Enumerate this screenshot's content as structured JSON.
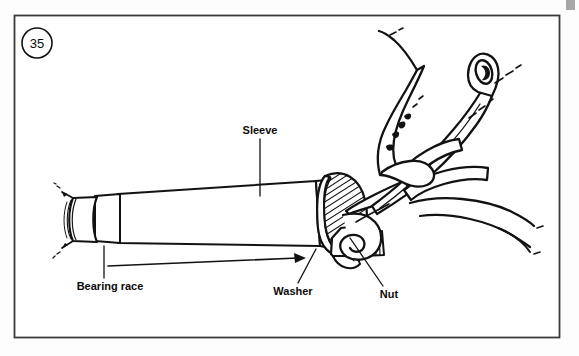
{
  "figure": {
    "number": "35",
    "caption_style": "circled-number",
    "border_color": "#3a3a3a",
    "ink_color": "#121212",
    "background_color": "#fdfdfd",
    "frame": {
      "x": 14,
      "y": 15,
      "width": 546,
      "height": 323
    }
  },
  "labels": [
    {
      "id": "sleeve",
      "text": "Sleeve",
      "text_x": 260,
      "text_y": 133,
      "anchor": "middle",
      "leader": {
        "type": "line",
        "x1": 260,
        "y1": 139,
        "x2": 260,
        "y2": 196
      }
    },
    {
      "id": "bearing-race",
      "text": "Bearing race",
      "text_x": 110,
      "text_y": 289,
      "anchor": "middle",
      "leader": {
        "type": "line",
        "x1": 104,
        "y1": 246,
        "x2": 104,
        "y2": 278
      }
    },
    {
      "id": "washer",
      "text": "Washer",
      "text_x": 293,
      "text_y": 294,
      "anchor": "middle",
      "leader": {
        "type": "line",
        "x1": 298,
        "y1": 283,
        "x2": 316,
        "y2": 249
      }
    },
    {
      "id": "nut",
      "text": "Nut",
      "text_x": 389,
      "text_y": 297,
      "anchor": "middle",
      "leader": {
        "type": "line",
        "x1": 383,
        "y1": 286,
        "x2": 351,
        "y2": 240
      }
    }
  ],
  "pointer_arrow": {
    "id": "washer-pointer",
    "x1": 108,
    "y1": 266,
    "x2": 304,
    "y2": 258,
    "head": "solid-triangle"
  },
  "parts": [
    {
      "name": "sleeve",
      "description": "long tapered cylinder shaft"
    },
    {
      "name": "bearing race",
      "description": "ring band near left cut end of shaft"
    },
    {
      "name": "washer",
      "description": "hatched flange disc at right end of sleeve"
    },
    {
      "name": "nut",
      "description": "hex nut with threads gripped by wrench jaws"
    },
    {
      "name": "adjustable wrench",
      "description": "wrench with jaws on nut and handle with hanging hole"
    },
    {
      "name": "hand",
      "description": "hand gripping the wrench handle"
    }
  ]
}
